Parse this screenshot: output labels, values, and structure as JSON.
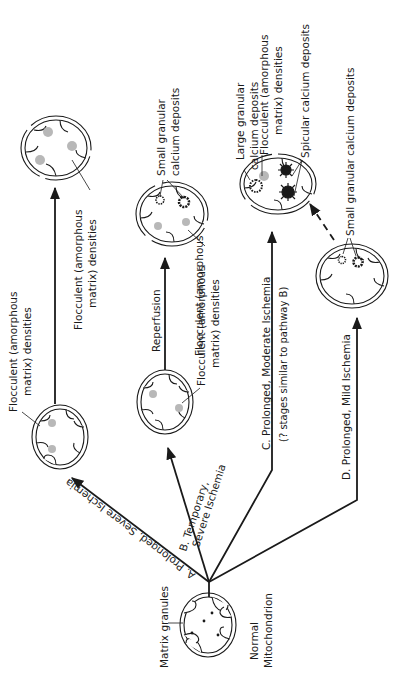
{
  "nodes": {
    "normal": {
      "label_line1": "Normal",
      "label_line2": "Mitochondrion",
      "granules_label": "Matrix granules"
    },
    "a_mid": {
      "label_line1": "Flocculent  (amorphous",
      "label_line2": "matrix)  densities"
    },
    "a_end": {
      "label_line1": "Flocculent  (amorphous",
      "label_line2": "matrix)  densities"
    },
    "b_mid": {
      "label_line1": "Flocculent  (amorphous",
      "label_line2": "matrix)  densities"
    },
    "b_end": {
      "calcium_line1": "Small  granular",
      "calcium_line2": "calcium  deposits",
      "floc_line1": "Flocculent  (amorphous",
      "floc_line2": "matrix)  densities"
    },
    "c_end": {
      "large_line1": "Large  granular",
      "large_line2": "calcium  deposits",
      "floc_line1": "Flocculent  (amorphous",
      "floc_line2": "matrix)  densities",
      "spicular": "Spicular  calcium  deposits"
    },
    "d_end": {
      "small": "Small  granular  calcium  deposits"
    }
  },
  "pathways": {
    "a": {
      "label": "A. Prolonged,  Severe  Ischemia"
    },
    "b": {
      "label_line1": "B. Temporary,",
      "label_line2": "Severe  Ischemia",
      "next_label": "Reperfusion"
    },
    "c": {
      "label_line1": "C. Prolonged,  Moderate  Ischemia",
      "label_line2": "(? stages  similar  to  pathway  B)"
    },
    "d": {
      "label": "D. Prolonged,  Mild  Ischemia"
    }
  },
  "colors": {
    "ink": "#1a1a1a",
    "floc": "#b8b8b8",
    "background": "#ffffff"
  }
}
